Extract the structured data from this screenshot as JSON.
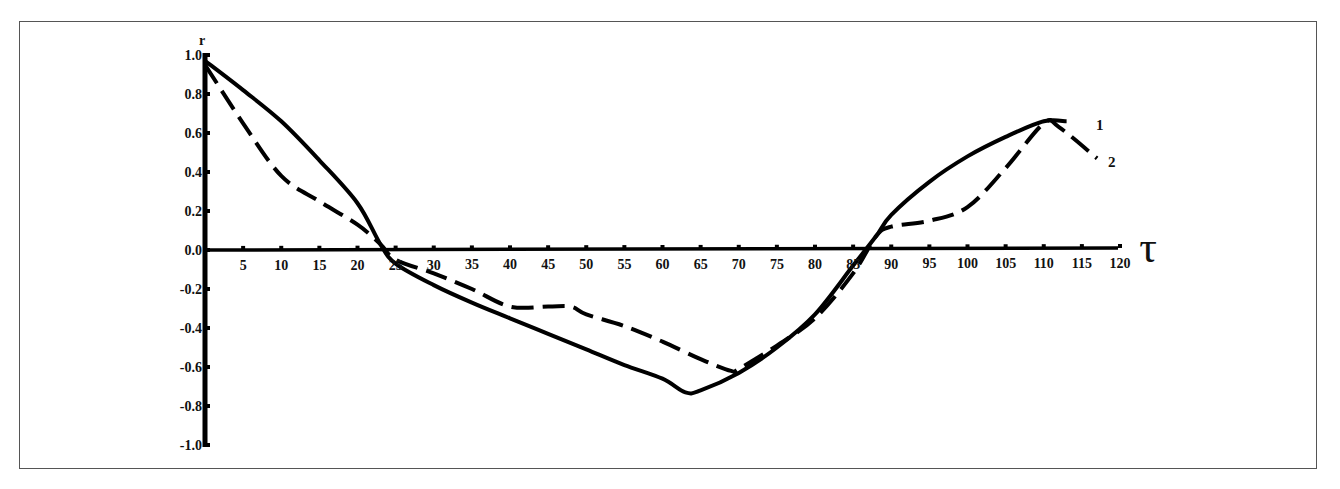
{
  "chart_data": {
    "type": "line",
    "title": "",
    "xlabel": "τ",
    "ylabel": "r",
    "xlim": [
      0,
      120
    ],
    "ylim": [
      -1.0,
      1.0
    ],
    "grid": false,
    "legend_position": "inline-right",
    "x_ticks": [
      5,
      10,
      15,
      20,
      25,
      30,
      35,
      40,
      45,
      50,
      55,
      60,
      65,
      70,
      75,
      80,
      85,
      90,
      95,
      100,
      105,
      110,
      115,
      120
    ],
    "y_ticks": [
      "1.0",
      "0.8",
      "0.6",
      "0.4",
      "0.2",
      "0.0",
      "-0.2",
      "-0.4",
      "-0.6",
      "-0.8",
      "-1.0"
    ],
    "series": [
      {
        "name": "1",
        "style": "solid",
        "x": [
          0,
          5,
          10,
          15,
          20,
          23,
          25,
          30,
          35,
          40,
          45,
          50,
          55,
          60,
          63,
          65,
          70,
          75,
          80,
          85,
          88,
          90,
          95,
          100,
          105,
          110,
          113
        ],
        "values": [
          0.97,
          0.82,
          0.66,
          0.46,
          0.24,
          0.03,
          -0.07,
          -0.18,
          -0.27,
          -0.35,
          -0.43,
          -0.51,
          -0.59,
          -0.66,
          -0.73,
          -0.72,
          -0.63,
          -0.5,
          -0.33,
          -0.08,
          0.07,
          0.18,
          0.35,
          0.48,
          0.58,
          0.66,
          0.66
        ]
      },
      {
        "name": "2",
        "style": "dashed",
        "x": [
          0,
          5,
          10,
          15,
          20,
          23,
          25,
          30,
          35,
          40,
          45,
          48,
          50,
          55,
          60,
          65,
          69,
          70,
          75,
          80,
          85,
          88,
          90,
          95,
          100,
          105,
          110,
          112,
          117
        ],
        "values": [
          0.95,
          0.65,
          0.38,
          0.25,
          0.13,
          0.03,
          -0.05,
          -0.12,
          -0.2,
          -0.29,
          -0.29,
          -0.29,
          -0.33,
          -0.39,
          -0.47,
          -0.56,
          -0.62,
          -0.61,
          -0.49,
          -0.35,
          -0.12,
          0.07,
          0.12,
          0.15,
          0.22,
          0.42,
          0.65,
          0.63,
          0.47
        ]
      }
    ]
  },
  "axes": {
    "y_title": "r",
    "x_title": "τ",
    "series_labels": [
      "1",
      "2"
    ]
  }
}
